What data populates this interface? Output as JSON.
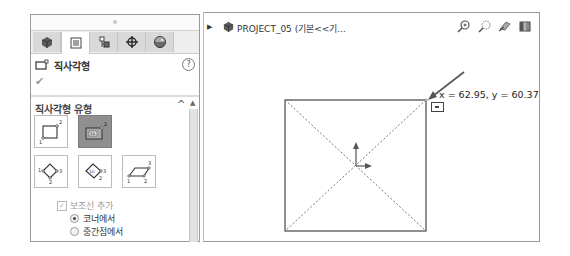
{
  "property_manager": {
    "tabs": [
      {
        "name": "feature-manager",
        "icon": "part-tree-icon",
        "active": false
      },
      {
        "name": "property-manager",
        "icon": "property-list-icon",
        "active": true
      },
      {
        "name": "configuration-manager",
        "icon": "configuration-icon",
        "active": false
      },
      {
        "name": "dimxpert-manager",
        "icon": "crosshair-icon",
        "active": false
      },
      {
        "name": "display-manager",
        "icon": "appearance-icon",
        "active": false
      }
    ],
    "title": "직사각형",
    "help_label": "?",
    "ok_label": "✔",
    "section": {
      "title": "직사각형 유형",
      "collapse_glyph": "^",
      "rect_types": [
        {
          "name": "corner-rectangle",
          "selected": false
        },
        {
          "name": "center-rectangle",
          "selected": true
        },
        {
          "name": "3-point-corner-rectangle",
          "selected": false
        },
        {
          "name": "3-point-center-rectangle",
          "selected": false
        },
        {
          "name": "parallelogram",
          "selected": false
        }
      ],
      "construction_checkbox": {
        "label": "보조선 추가",
        "checked": true,
        "disabled": true
      },
      "radio_options": [
        {
          "label": "코너에서",
          "selected": true
        },
        {
          "label": "중간점에서",
          "selected": false
        }
      ]
    }
  },
  "viewport": {
    "tree_item": "PROJECT_05  (기본<<기...",
    "hud_icons": [
      "zoom-to-fit-icon",
      "zoom-to-area-icon",
      "previous-view-icon",
      "section-view-icon"
    ],
    "coordinates": "x = 62.95, y = 60.37"
  },
  "colors": {
    "panel_border": "#9a9a9a",
    "selected_button": "#8f8f8f",
    "sketch_line": "#555555"
  }
}
